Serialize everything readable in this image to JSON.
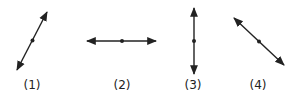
{
  "figures": [
    {
      "label": "(1)",
      "orientation": "diagonal-up-right"
    },
    {
      "label": "(2)",
      "orientation": "horizontal"
    },
    {
      "label": "(3)",
      "orientation": "vertical"
    },
    {
      "label": "(4)",
      "orientation": "diagonal-down-right"
    }
  ],
  "colors": {
    "line": "#222222",
    "text": "#222222"
  }
}
